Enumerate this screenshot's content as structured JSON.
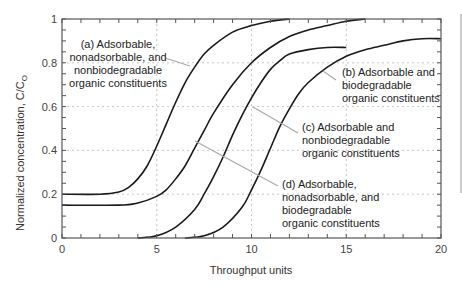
{
  "chart_data": {
    "type": "line",
    "title": "",
    "xlabel": "Throughput units",
    "ylabel": "Normalized concentration, C/C",
    "ylabel_subscript": "O",
    "xlim": [
      0,
      20
    ],
    "ylim": [
      0,
      1
    ],
    "xticks": [
      0,
      5,
      10,
      15,
      20
    ],
    "xtick_labels": [
      "0",
      "5",
      "10",
      "15",
      "20"
    ],
    "yticks": [
      0,
      0.2,
      0.4,
      0.6,
      0.8,
      1
    ],
    "ytick_labels": [
      "0",
      "0.2",
      "0.4",
      "0.6",
      "0.8",
      "1"
    ],
    "grid": true,
    "legend_position": "none (inline annotations)",
    "series": [
      {
        "name": "(a) Adsorbable, nonadsorbable, and nonbiodegradable organic constituents",
        "label_lines": [
          "(a) Adsorbable,",
          "nonadsorbable, and",
          "nonbiodegradable",
          "organic constituents"
        ],
        "x": [
          0,
          2,
          3,
          3.5,
          4,
          4.5,
          5,
          5.5,
          6,
          6.5,
          7,
          7.5,
          8,
          9,
          10,
          11,
          12
        ],
        "y": [
          0.2,
          0.2,
          0.21,
          0.23,
          0.27,
          0.33,
          0.42,
          0.52,
          0.62,
          0.71,
          0.78,
          0.84,
          0.88,
          0.94,
          0.97,
          0.99,
          1.0
        ]
      },
      {
        "name": "(b) Adsorbable and biodegradable organic constituents",
        "label_lines": [
          "(b) Adsorbable and",
          "biodegradable",
          "organic constituents"
        ],
        "x": [
          0,
          3,
          4,
          5,
          5.5,
          6,
          6.5,
          7,
          7.5,
          8,
          9,
          10,
          11,
          12,
          13,
          14,
          15,
          16
        ],
        "y": [
          0.15,
          0.15,
          0.16,
          0.19,
          0.22,
          0.27,
          0.33,
          0.41,
          0.49,
          0.57,
          0.7,
          0.8,
          0.87,
          0.92,
          0.95,
          0.97,
          0.99,
          1.0
        ]
      },
      {
        "name": "(c) Adsorbable and nonbiodegradable organic constituents",
        "label_lines": [
          "(c) Adsorbable and",
          "nonbiodegradable",
          "organic constituents"
        ],
        "x": [
          4,
          5,
          6,
          7,
          7.5,
          8,
          8.5,
          9,
          9.5,
          10,
          10.5,
          11,
          11.5,
          12,
          13,
          14,
          15
        ],
        "y": [
          0,
          0.01,
          0.05,
          0.13,
          0.2,
          0.28,
          0.37,
          0.47,
          0.56,
          0.64,
          0.71,
          0.77,
          0.81,
          0.84,
          0.86,
          0.87,
          0.87
        ]
      },
      {
        "name": "(d) Adsorbable, nonadsorbable, and biodegradable organic constituents",
        "label_lines": [
          "(d) Adsorbable,",
          "nonadsorbable, and",
          "biodegradable",
          "organic constituents"
        ],
        "x": [
          6.5,
          7.5,
          8.5,
          9.5,
          10,
          10.5,
          11,
          11.5,
          12,
          12.5,
          13,
          14,
          15,
          16,
          17,
          18,
          19,
          20
        ],
        "y": [
          0,
          0.01,
          0.05,
          0.14,
          0.22,
          0.31,
          0.41,
          0.51,
          0.59,
          0.66,
          0.71,
          0.78,
          0.83,
          0.86,
          0.88,
          0.9,
          0.91,
          0.91
        ]
      }
    ],
    "annotations": [
      {
        "series": "a",
        "text_x": 183,
        "text_y": 48,
        "leader": [
          [
            165,
            58
          ],
          [
            190,
            66
          ]
        ]
      },
      {
        "series": "b",
        "text_x": 342,
        "text_y": 76,
        "leader": [
          [
            336,
            80
          ],
          [
            323,
            71
          ]
        ]
      },
      {
        "series": "c",
        "text_x": 302,
        "text_y": 131,
        "leader": [
          [
            298,
            133
          ],
          [
            253,
            107
          ]
        ]
      },
      {
        "series": "d",
        "text_x": 282,
        "text_y": 188,
        "leader": [
          [
            278,
            186
          ],
          [
            195,
            141
          ]
        ]
      }
    ]
  },
  "figure": {
    "xlabel": "Throughput units",
    "ylabel_main": "Normalized concentration, C/C",
    "ylabel_sub": "O"
  }
}
